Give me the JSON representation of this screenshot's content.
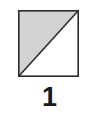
{
  "figure": {
    "caption": "1",
    "background_color": "#ffffff",
    "shape": {
      "name": "square-split-by-diagonal",
      "outline_color": "#2b2b2b",
      "outline_width": 1.6,
      "width": 61,
      "height": 67,
      "fill_upper_left": "#d2d2d2",
      "fill_lower_right": "#ffffff",
      "diagonal": {
        "name": "diagonal-line",
        "from": "bottom-left",
        "to": "top-right",
        "color": "#2b2b2b",
        "width": 1.6
      },
      "regions": [
        {
          "label": "upper-left-triangle",
          "fill": "#d2d2d2",
          "fraction": "1/2"
        },
        {
          "label": "lower-right-triangle",
          "fill": "#ffffff",
          "fraction": "1/2"
        }
      ]
    }
  }
}
